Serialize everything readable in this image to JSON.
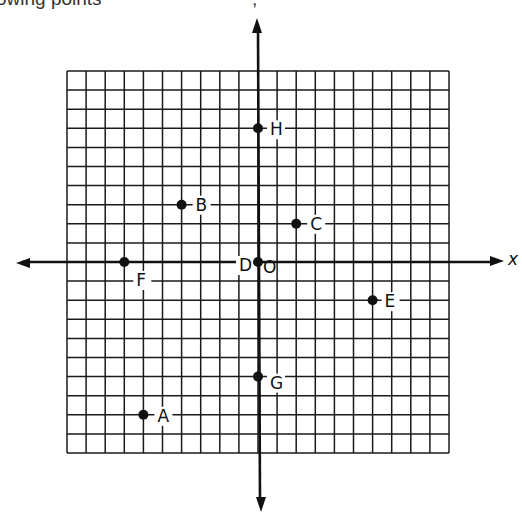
{
  "caption": {
    "text": "owing points",
    "trailing": ";"
  },
  "grid": {
    "x_range": [
      -10,
      10
    ],
    "y_range": [
      -10,
      10
    ],
    "step": 1
  },
  "axes": {
    "x_label": "x",
    "origin_label": "O"
  },
  "points": [
    {
      "label": "A",
      "x": -6,
      "y": -8
    },
    {
      "label": "B",
      "x": -4,
      "y": 3
    },
    {
      "label": "C",
      "x": 2,
      "y": 2
    },
    {
      "label": "D",
      "x": 0,
      "y": 0
    },
    {
      "label": "E",
      "x": 6,
      "y": -2
    },
    {
      "label": "F",
      "x": -7,
      "y": 0
    },
    {
      "label": "G",
      "x": 0,
      "y": -6
    },
    {
      "label": "H",
      "x": 0,
      "y": 7
    }
  ],
  "colors": {
    "ink": "#111111",
    "paper": "#ffffff"
  }
}
